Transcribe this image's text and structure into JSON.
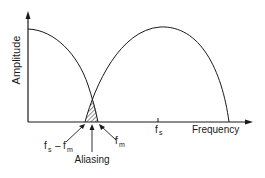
{
  "diagram": {
    "axes": {
      "y_label": "Amplitude",
      "x_label": "Frequency"
    },
    "labels": {
      "fs_main": "f",
      "fs_sub": "s",
      "fm_main": "f",
      "fm_sub": "m",
      "fs_minus_fm_f1": "f",
      "fs_minus_fm_s": "s",
      "fs_minus_fm_dash": "–",
      "fs_minus_fm_f2": "f",
      "fs_minus_fm_m": "m",
      "aliasing": "Aliasing"
    },
    "colors": {
      "ink": "#1a1a1a",
      "background": "#ffffff"
    }
  }
}
